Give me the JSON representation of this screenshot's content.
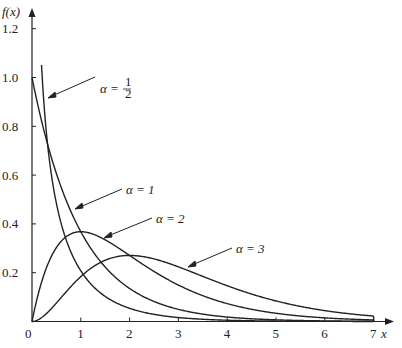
{
  "chart_data": {
    "type": "line",
    "title": "",
    "xlabel": "x",
    "ylabel": "f(x)",
    "xlim": [
      0,
      7
    ],
    "ylim": [
      0,
      1.2
    ],
    "grid": false,
    "x_ticks": [
      "0",
      "1",
      "2",
      "3",
      "4",
      "5",
      "6",
      "7"
    ],
    "y_ticks": [
      "0.2",
      "0.4",
      "0.6",
      "0.8",
      "1.0",
      "1.2"
    ],
    "legend": "inline annotations with arrows",
    "series": [
      {
        "name": "α = 1/2",
        "alpha": 0.5,
        "x": [
          0.2,
          0.5,
          1,
          2,
          3,
          4,
          5,
          6,
          7
        ],
        "values": [
          1.15,
          0.69,
          0.45,
          0.27,
          0.15,
          0.08,
          0.04,
          0.02,
          0.01
        ]
      },
      {
        "name": "α = 1",
        "alpha": 1,
        "x": [
          0,
          0.5,
          1,
          2,
          3,
          4,
          5,
          6,
          7
        ],
        "values": [
          1.0,
          0.61,
          0.37,
          0.14,
          0.05,
          0.02,
          0.01,
          0.0,
          0.0
        ]
      },
      {
        "name": "α = 2",
        "alpha": 2,
        "x": [
          0,
          0.5,
          1,
          2,
          3,
          4,
          5,
          6,
          7
        ],
        "values": [
          0.0,
          0.3,
          0.37,
          0.27,
          0.15,
          0.07,
          0.03,
          0.01,
          0.01
        ]
      },
      {
        "name": "α = 3",
        "alpha": 3,
        "x": [
          0,
          0.5,
          1,
          2,
          3,
          4,
          5,
          6,
          7
        ],
        "values": [
          0.0,
          0.08,
          0.18,
          0.27,
          0.22,
          0.15,
          0.08,
          0.04,
          0.02
        ]
      }
    ]
  },
  "labels": {
    "ylabel": "f(x)",
    "xlabel": "x",
    "origin": "0",
    "ann_half_prefix": "α =",
    "ann_half_num": "1",
    "ann_half_den": "2",
    "ann_1": "α = 1",
    "ann_2": "α = 2",
    "ann_3": "α = 3"
  }
}
